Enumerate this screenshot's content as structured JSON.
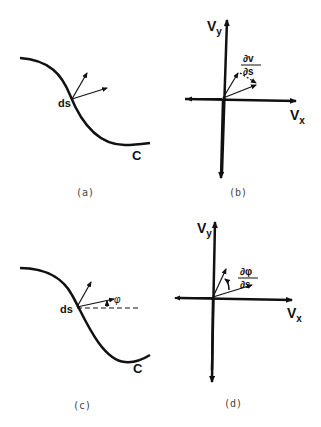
{
  "figure": {
    "panels": [
      {
        "id": "a",
        "caption": "(a)",
        "curve_label": "C",
        "point_label": "ds"
      },
      {
        "id": "b",
        "caption": "(b)",
        "x_axis_label": "V",
        "x_axis_sub": "x",
        "y_axis_label": "V",
        "y_axis_sub": "y",
        "fraction_num": "∂v",
        "fraction_den": "∂s"
      },
      {
        "id": "c",
        "caption": "(c)",
        "curve_label": "C",
        "point_label": "ds",
        "angle_label": "φ"
      },
      {
        "id": "d",
        "caption": "(d)",
        "x_axis_label": "V",
        "x_axis_sub": "x",
        "y_axis_label": "V",
        "y_axis_sub": "y",
        "fraction_num": "∂φ",
        "fraction_den": "∂s"
      }
    ]
  },
  "colors": {
    "ink": "#111111",
    "background": "#ffffff"
  }
}
